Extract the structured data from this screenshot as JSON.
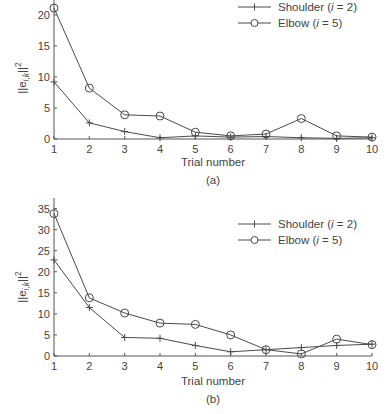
{
  "chart_data": [
    {
      "type": "line",
      "panel_label": "(a)",
      "xlabel": "Trial number",
      "ylabel": "||e_{i,k}||^2",
      "ylabel_parts": {
        "base": "||e",
        "sub": "i,k",
        "tail": "||",
        "sup": "2"
      },
      "x": [
        1,
        2,
        3,
        4,
        5,
        6,
        7,
        8,
        9,
        10
      ],
      "xticks": [
        "1",
        "2",
        "3",
        "4",
        "5",
        "6",
        "7",
        "8",
        "9",
        "10"
      ],
      "yticks": [
        "0",
        "5",
        "10",
        "15",
        "20"
      ],
      "ytick_values": [
        0,
        5,
        10,
        15,
        20
      ],
      "ylim": [
        0,
        22.4
      ],
      "xlim": [
        1,
        10
      ],
      "grid": false,
      "legend_position": "upper right",
      "series": [
        {
          "name": "Shoulder (i = 2)",
          "name_parts": {
            "pre": "Shoulder (",
            "var": "i",
            "post": " = 2)"
          },
          "marker": "plus",
          "values": [
            9.2,
            2.6,
            1.2,
            0.2,
            0.5,
            0.3,
            0.4,
            0.2,
            0.1,
            0.2
          ]
        },
        {
          "name": "Elbow (i = 5)",
          "name_parts": {
            "pre": "Elbow (",
            "var": "i",
            "post": " = 5)"
          },
          "marker": "circle",
          "values": [
            21.1,
            8.2,
            3.9,
            3.7,
            1.1,
            0.5,
            0.8,
            3.3,
            0.5,
            0.3
          ]
        }
      ]
    },
    {
      "type": "line",
      "panel_label": "(b)",
      "xlabel": "Trial number",
      "ylabel": "||e_{i,k}||^2",
      "ylabel_parts": {
        "base": "||e",
        "sub": "i,k",
        "tail": "||",
        "sup": "2"
      },
      "x": [
        1,
        2,
        3,
        4,
        5,
        6,
        7,
        8,
        9,
        10
      ],
      "xticks": [
        "1",
        "2",
        "3",
        "4",
        "5",
        "6",
        "7",
        "8",
        "9",
        "10"
      ],
      "yticks": [
        "0",
        "5",
        "10",
        "15",
        "20",
        "25",
        "30",
        "35"
      ],
      "ytick_values": [
        0,
        5,
        10,
        15,
        20,
        25,
        30,
        35
      ],
      "ylim": [
        0,
        37.5
      ],
      "xlim": [
        1,
        10
      ],
      "grid": false,
      "legend_position": "upper right",
      "series": [
        {
          "name": "Shoulder (i = 2)",
          "name_parts": {
            "pre": "Shoulder (",
            "var": "i",
            "post": " = 2)"
          },
          "marker": "plus",
          "values": [
            22.8,
            11.5,
            4.4,
            4.2,
            2.5,
            1.0,
            1.5,
            2.0,
            2.5,
            2.8
          ]
        },
        {
          "name": "Elbow (i = 5)",
          "name_parts": {
            "pre": "Elbow (",
            "var": "i",
            "post": " = 5)"
          },
          "marker": "circle",
          "values": [
            33.8,
            13.8,
            10.2,
            7.8,
            7.5,
            5.0,
            1.5,
            0.5,
            4.0,
            2.7
          ]
        }
      ]
    }
  ],
  "colors": {
    "line": "#4a4a4a",
    "axis": "#555555",
    "text": "#444444"
  }
}
